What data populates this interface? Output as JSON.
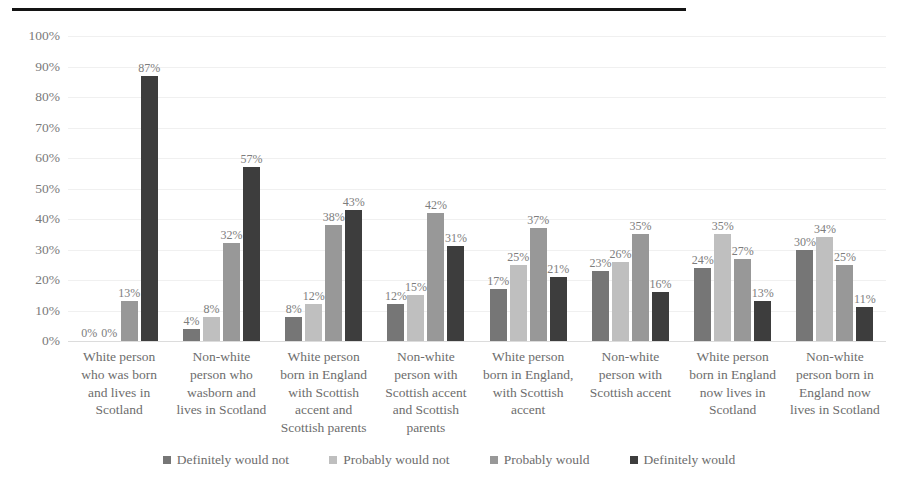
{
  "chart_data": {
    "type": "bar",
    "title": "",
    "subtitle": "",
    "xlabel": "",
    "ylabel": "",
    "ylim": [
      0,
      100
    ],
    "ytick_labels": [
      "100%",
      "90%",
      "80%",
      "70%",
      "60%",
      "50%",
      "40%",
      "30%",
      "20%",
      "10%",
      "0%"
    ],
    "ytick_values": [
      100,
      90,
      80,
      70,
      60,
      50,
      40,
      30,
      20,
      10,
      0
    ],
    "grid": true,
    "legend_position": "bottom",
    "value_suffix": "%",
    "categories": [
      "White person who was born and lives in Scotland",
      "Non-white person who wasborn and lives in Scotland",
      "White person born in England with Scottish accent and Scottish parents",
      "Non-white person with Scottish accent and Scottish parents",
      "White person born in England, with Scottish accent",
      "Non-white person with Scottish accent",
      "White person born in England now lives in Scotland",
      "Non-white person born in England now lives in Scotland"
    ],
    "series": [
      {
        "name": "Definitely would not",
        "color": "#767676",
        "values": [
          0,
          4,
          8,
          12,
          17,
          23,
          24,
          30
        ],
        "labels": [
          "0%",
          "4%",
          "8%",
          "12%",
          "17%",
          "23%",
          "24%",
          "30%"
        ]
      },
      {
        "name": "Probably would not",
        "color": "#bfbfbf",
        "values": [
          0,
          8,
          12,
          15,
          25,
          26,
          35,
          34
        ],
        "labels": [
          "0%",
          "8%",
          "12%",
          "15%",
          "25%",
          "26%",
          "35%",
          "34%"
        ]
      },
      {
        "name": "Probably would",
        "color": "#989898",
        "values": [
          13,
          32,
          38,
          42,
          37,
          35,
          27,
          25
        ],
        "labels": [
          "13%",
          "32%",
          "38%",
          "42%",
          "37%",
          "35%",
          "27%",
          "25%"
        ]
      },
      {
        "name": "Definitely would",
        "color": "#3d3d3d",
        "values": [
          87,
          57,
          43,
          31,
          21,
          16,
          13,
          11
        ],
        "labels": [
          "87%",
          "57%",
          "43%",
          "31%",
          "21%",
          "16%",
          "13%",
          "11%"
        ]
      }
    ]
  }
}
